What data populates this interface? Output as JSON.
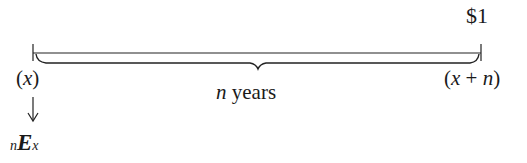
{
  "diagram": {
    "type": "timeline",
    "amount_label": "$1",
    "start_label": {
      "open": "(",
      "var": "x",
      "close": ")"
    },
    "end_label": {
      "open": "(",
      "var": "x",
      "op": " + ",
      "var2": "n",
      "close": ")"
    },
    "span_label": {
      "var": "n",
      "text": " years"
    },
    "result_label": {
      "pre_sub": "n",
      "symbol": "E",
      "post_sub": "x"
    },
    "arrow": "down"
  }
}
